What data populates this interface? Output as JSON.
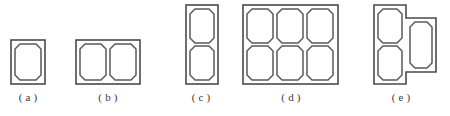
{
  "figure": {
    "background_color": "#ffffff",
    "outline_color": "#4a4a4a",
    "cell_color": "#5a5a5a",
    "caption_color": "#3a3a3a",
    "panels": [
      {
        "id": "a",
        "caption": "( a )",
        "rows": 1,
        "columns": 1,
        "cell_count": 1,
        "shape": "rectangle"
      },
      {
        "id": "b",
        "caption": "( b )",
        "rows": 1,
        "columns": 2,
        "cell_count": 2,
        "shape": "rectangle"
      },
      {
        "id": "c",
        "caption": "( c )",
        "rows": 2,
        "columns": 1,
        "cell_count": 2,
        "shape": "rectangle"
      },
      {
        "id": "d",
        "caption": "( d )",
        "rows": 2,
        "columns": 3,
        "cell_count": 6,
        "shape": "rectangle"
      },
      {
        "id": "e",
        "caption": "( e )",
        "rows": 2,
        "columns": 2,
        "cell_count": 3,
        "shape": "t-step"
      }
    ]
  }
}
